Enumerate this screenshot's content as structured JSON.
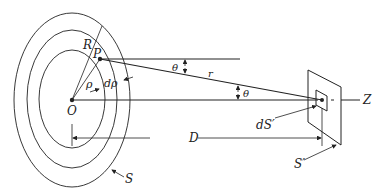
{
  "diagram": {
    "labels": {
      "R": "R",
      "P": "P",
      "rho": "ρ",
      "drho": "dρ",
      "O": "O",
      "theta_top": "θ",
      "theta_axis": "θ",
      "r": "r",
      "Z": "Z",
      "D": "D",
      "dS_prime": "dS′",
      "S_prime": "S′",
      "S": "S"
    },
    "colors": {
      "line": "#222222",
      "background": "#ffffff"
    }
  }
}
